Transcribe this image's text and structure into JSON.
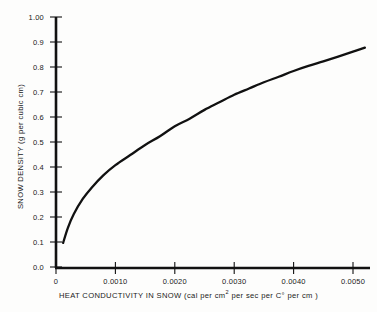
{
  "chart_data": {
    "type": "line",
    "title": "",
    "xlabel": "HEAT CONDUCTIVITY IN SNOW (cal per cm2 per sec per C° per cm)",
    "xlabel_prefix": "HEAT CONDUCTIVITY IN SNOW (cal per cm",
    "xlabel_sup": "2",
    "xlabel_suffix": " per sec  per C° per cm )",
    "ylabel": "SNOW DENSITY (g per cubic cm)",
    "xlim": [
      0,
      0.0053
    ],
    "ylim": [
      0.0,
      1.0
    ],
    "grid": false,
    "legend": "none",
    "line_color": "#111111",
    "axis_color": "#111111",
    "background_color": "#fdfdfc",
    "xticks": [
      0,
      0.001,
      0.002,
      0.003,
      0.004,
      0.005
    ],
    "xtick_labels": [
      "0",
      "0.0010",
      "0.0020",
      "0.0030",
      "0.0040",
      "0.0050"
    ],
    "yticks": [
      0.0,
      0.1,
      0.2,
      0.3,
      0.4,
      0.5,
      0.6,
      0.7,
      0.8,
      0.9,
      1.0
    ],
    "ytick_labels": [
      "0.0",
      "0.1",
      "0.2",
      "0.3",
      "0.4",
      "0.5",
      "0.6",
      "0.7",
      "0.8",
      "0.9",
      "1.00"
    ],
    "series": [
      {
        "name": "snow density vs heat conductivity",
        "x": [
          0.00012,
          0.0002,
          0.0003,
          0.00045,
          0.0006,
          0.0008,
          0.001,
          0.00125,
          0.0015,
          0.00175,
          0.002,
          0.00225,
          0.0025,
          0.00275,
          0.003,
          0.00325,
          0.0035,
          0.00375,
          0.004,
          0.00425,
          0.0045,
          0.00475,
          0.005,
          0.0052
        ],
        "y": [
          0.1,
          0.16,
          0.215,
          0.275,
          0.32,
          0.37,
          0.41,
          0.45,
          0.49,
          0.525,
          0.565,
          0.595,
          0.63,
          0.66,
          0.69,
          0.715,
          0.74,
          0.762,
          0.785,
          0.805,
          0.823,
          0.842,
          0.862,
          0.878
        ]
      }
    ]
  }
}
